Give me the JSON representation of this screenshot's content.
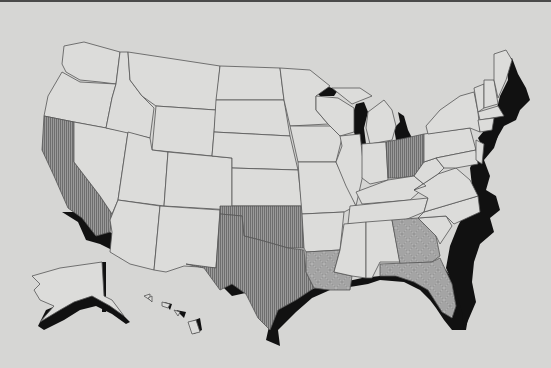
{
  "map": {
    "title": "",
    "region": "United States",
    "background_color": "#d6d6d4",
    "plain_fill": "#dcdcda",
    "border_color": "#555555",
    "coastal_fill": "#111111",
    "legend": [],
    "categories": [
      {
        "pattern": "vertical-lines",
        "fill": "#8a8a8a",
        "states": [
          "California",
          "Texas",
          "Oklahoma",
          "Ohio"
        ]
      },
      {
        "pattern": "concentric-squares",
        "fill": "#a8a8a8",
        "states": [
          "Louisiana",
          "Georgia",
          "Florida"
        ]
      },
      {
        "pattern": "solid-black-coastal-band",
        "fill": "#111111",
        "regions": [
          "Southern California coast",
          "Gulf of Mexico coast",
          "Atlantic coast",
          "Great Lakes (Lake Michigan, Lake Erie, Lake Superior)",
          "New England coast",
          "Alaska coast",
          "Hawaii coast"
        ]
      }
    ],
    "insets": [
      "Alaska",
      "Hawaii"
    ]
  }
}
